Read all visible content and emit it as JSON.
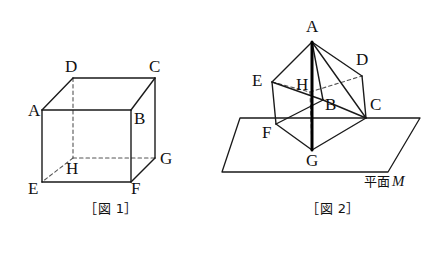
{
  "page": {
    "width": 444,
    "height": 254,
    "background": "#ffffff",
    "ink": "#1a1a1a"
  },
  "figure1": {
    "caption": "［図 1］",
    "description": "cube-ABCD-EFGH",
    "vertices": [
      {
        "name": "A",
        "label": "A",
        "x": 42,
        "y": 110,
        "label_x": 28,
        "label_y": 116,
        "hidden": false
      },
      {
        "name": "B",
        "label": "B",
        "x": 131,
        "y": 110,
        "label_x": 134,
        "label_y": 124,
        "hidden": false
      },
      {
        "name": "C",
        "label": "C",
        "x": 155,
        "y": 78,
        "label_x": 149,
        "label_y": 72,
        "hidden": false
      },
      {
        "name": "D",
        "label": "D",
        "x": 73,
        "y": 78,
        "label_x": 65,
        "label_y": 72,
        "hidden": false
      },
      {
        "name": "E",
        "label": "E",
        "x": 42,
        "y": 182,
        "label_x": 28,
        "label_y": 194,
        "hidden": false
      },
      {
        "name": "F",
        "label": "F",
        "x": 131,
        "y": 182,
        "label_x": 131,
        "label_y": 194,
        "hidden": false
      },
      {
        "name": "G",
        "label": "G",
        "x": 155,
        "y": 158,
        "label_x": 160,
        "label_y": 164,
        "hidden": false
      },
      {
        "name": "H",
        "label": "H",
        "x": 73,
        "y": 158,
        "label_x": 66,
        "label_y": 174,
        "hidden": true
      }
    ],
    "solid_edges": [
      [
        "A",
        "B"
      ],
      [
        "B",
        "F"
      ],
      [
        "F",
        "E"
      ],
      [
        "E",
        "A"
      ],
      [
        "A",
        "D"
      ],
      [
        "D",
        "C"
      ],
      [
        "C",
        "B"
      ],
      [
        "C",
        "G"
      ],
      [
        "G",
        "F"
      ]
    ],
    "hidden_edges": [
      [
        "D",
        "H"
      ],
      [
        "H",
        "G"
      ],
      [
        "H",
        "E"
      ]
    ]
  },
  "figure2": {
    "caption": "［図 2］",
    "description": "cube-tilted-on-plane-with-vertical-diagonal-AG",
    "plane_label_text": "平面",
    "plane_label_m": "M",
    "plane_label_x": 364,
    "plane_label_y": 186,
    "plane_corners": [
      {
        "x": 240,
        "y": 118
      },
      {
        "x": 420,
        "y": 118
      },
      {
        "x": 388,
        "y": 172
      },
      {
        "x": 222,
        "y": 172
      }
    ],
    "vertices": [
      {
        "name": "A",
        "label": "A",
        "x": 312,
        "y": 42,
        "label_x": 306,
        "label_y": 32,
        "hidden": false
      },
      {
        "name": "D",
        "label": "D",
        "x": 362,
        "y": 76,
        "label_x": 356,
        "label_y": 65,
        "hidden": false
      },
      {
        "name": "E",
        "label": "E",
        "x": 272,
        "y": 82,
        "label_x": 252,
        "label_y": 86,
        "hidden": false
      },
      {
        "name": "H",
        "label": "H",
        "x": 310,
        "y": 92,
        "label_x": 296,
        "label_y": 90,
        "hidden": true
      },
      {
        "name": "B",
        "label": "B",
        "x": 323,
        "y": 100,
        "label_x": 325,
        "label_y": 110,
        "hidden": false
      },
      {
        "name": "C",
        "label": "C",
        "x": 366,
        "y": 118,
        "label_x": 370,
        "label_y": 110,
        "hidden": false
      },
      {
        "name": "F",
        "label": "F",
        "x": 276,
        "y": 124,
        "label_x": 262,
        "label_y": 138,
        "hidden": false
      },
      {
        "name": "G",
        "label": "G",
        "x": 312,
        "y": 150,
        "label_x": 306,
        "label_y": 166,
        "hidden": false
      }
    ],
    "solid_edges": [
      [
        "A",
        "E"
      ],
      [
        "A",
        "D"
      ],
      [
        "A",
        "B"
      ],
      [
        "A",
        "C"
      ],
      [
        "E",
        "F"
      ],
      [
        "D",
        "C"
      ],
      [
        "B",
        "C"
      ],
      [
        "F",
        "G"
      ],
      [
        "C",
        "G"
      ],
      [
        "E",
        "B"
      ],
      [
        "B",
        "F"
      ]
    ],
    "hidden_edges": [
      [
        "E",
        "H"
      ],
      [
        "H",
        "D"
      ],
      [
        "H",
        "G"
      ]
    ],
    "thick_edges": [
      [
        "A",
        "G"
      ]
    ]
  }
}
